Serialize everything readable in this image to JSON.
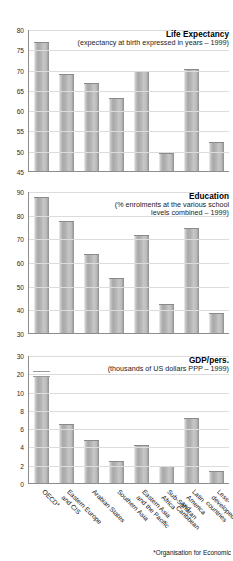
{
  "categories": [
    "OECD*",
    "Eastern Europe\nand CIS",
    "Arabian States",
    "Southern Asia",
    "Eastern Asia\nand the Pacific",
    "Sub-Saharan\nAfrica",
    "Latin America\nand Caribbean",
    "Less-developed\ncountries"
  ],
  "footnote": "*Organisation for Economic",
  "chart_data": [
    {
      "type": "bar",
      "title": "Life Expectancy",
      "subtitle": "(expectancy at birth expressed in years – 1999)",
      "xlabel": "",
      "ylabel": "",
      "ylim": [
        45,
        80
      ],
      "yticks": [
        45,
        50,
        55,
        60,
        65,
        70,
        75,
        80
      ],
      "grid": true,
      "categories": [
        "OECD*",
        "Eastern Europe and CIS",
        "Arabian States",
        "Southern Asia",
        "Eastern Asia and the Pacific",
        "Sub-Saharan Africa",
        "Latin America and Caribbean",
        "Less-developed countries"
      ],
      "values": [
        76.5,
        68.7,
        66.5,
        62.7,
        69.4,
        49.2,
        70.0,
        52.0
      ]
    },
    {
      "type": "bar",
      "title": "Education",
      "subtitle": "(% enrolments at the various school\nlevels combined – 1999)",
      "subtitle_line1": "(% enrolments at the various school",
      "subtitle_line2": "levels combined – 1999)",
      "xlabel": "",
      "ylabel": "",
      "ylim": [
        30,
        90
      ],
      "yticks": [
        30,
        40,
        50,
        60,
        70,
        80,
        90
      ],
      "grid": true,
      "categories": [
        "OECD*",
        "Eastern Europe and CIS",
        "Arabian States",
        "Southern Asia",
        "Eastern Asia and the Pacific",
        "Sub-Saharan Africa",
        "Latin America and Caribbean",
        "Less-developed countries"
      ],
      "values": [
        87.0,
        77.0,
        63.0,
        53.0,
        71.0,
        42.0,
        74.0,
        38.0
      ]
    },
    {
      "type": "bar",
      "title": "GDP/pers.",
      "subtitle": "(thousands of US dollars PPP – 1999)",
      "xlabel": "",
      "ylabel": "",
      "ylim": [
        0,
        30
      ],
      "yticks": [
        0,
        2,
        4,
        6,
        8,
        10,
        20,
        30
      ],
      "axis_break": "between 10 and 20",
      "grid": true,
      "categories": [
        "OECD*",
        "Eastern Europe and CIS",
        "Arabian States",
        "Southern Asia",
        "Eastern Asia and the Pacific",
        "Sub-Saharan Africa",
        "Latin America and Caribbean",
        "Less-developed countries"
      ],
      "values": [
        20.4,
        6.3,
        4.6,
        2.3,
        4.1,
        1.7,
        7.0,
        1.2
      ]
    }
  ]
}
